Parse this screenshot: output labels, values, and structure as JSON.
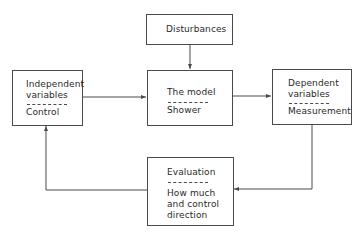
{
  "diagram": {
    "type": "control-loop block diagram",
    "boxes": {
      "disturbances": {
        "label": "Disturbances"
      },
      "independent": {
        "top": [
          "Independent",
          "variables"
        ],
        "bottom": [
          "Control"
        ]
      },
      "model": {
        "top": [
          "The model"
        ],
        "bottom": [
          "Shower"
        ]
      },
      "dependent": {
        "top": [
          "Dependent",
          "variables"
        ],
        "bottom": [
          "Measurement"
        ]
      },
      "evaluation": {
        "top": [
          "Evaluation"
        ],
        "bottom": [
          "How much",
          "and control",
          "direction"
        ]
      }
    },
    "connections": [
      {
        "from": "disturbances",
        "to": "model"
      },
      {
        "from": "independent",
        "to": "model"
      },
      {
        "from": "model",
        "to": "dependent"
      },
      {
        "from": "dependent",
        "to": "evaluation"
      },
      {
        "from": "evaluation",
        "to": "independent"
      }
    ],
    "colors": {
      "line": "#4a4a4a",
      "text": "#2a2a2a",
      "background": "#ffffff"
    }
  }
}
